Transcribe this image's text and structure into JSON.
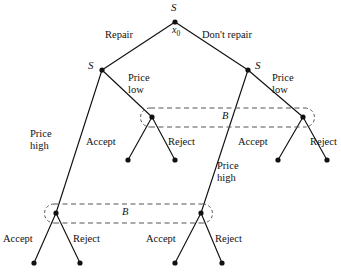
{
  "figure": {
    "kind": "extensive-form game tree",
    "background": "#ffffff",
    "ink": "#111111",
    "dash_color": "#555555",
    "width": 341,
    "height": 275
  },
  "nodes": {
    "root": {
      "label": "S",
      "name_label": "x0",
      "x": 175,
      "y": 22
    },
    "left_seller": {
      "label": "S",
      "x": 102,
      "y": 70
    },
    "right_seller": {
      "label": "S",
      "x": 248,
      "y": 70
    },
    "buyer_upper_left": {
      "label": "",
      "x": 152,
      "y": 117
    },
    "buyer_upper_right": {
      "label": "",
      "x": 303,
      "y": 117
    },
    "buyer_lower_left": {
      "label": "",
      "x": 56,
      "y": 213
    },
    "buyer_lower_right": {
      "label": "",
      "x": 201,
      "y": 213
    }
  },
  "leaves": [
    {
      "id": "leaf-1",
      "x": 128,
      "y": 160
    },
    {
      "id": "leaf-2",
      "x": 175,
      "y": 160
    },
    {
      "id": "leaf-3",
      "x": 278,
      "y": 160
    },
    {
      "id": "leaf-4",
      "x": 327,
      "y": 160
    },
    {
      "id": "leaf-5",
      "x": 34,
      "y": 263
    },
    {
      "id": "leaf-6",
      "x": 80,
      "y": 263
    },
    {
      "id": "leaf-7",
      "x": 175,
      "y": 263
    },
    {
      "id": "leaf-8",
      "x": 222,
      "y": 263
    }
  ],
  "actions": {
    "repair": "Repair",
    "dont_repair": "Don't repair",
    "price_low_left": "Price\nlow",
    "price_low_right": "Price\nlow",
    "price_high_left": "Price\nhigh",
    "price_high_right": "Price\nhigh",
    "accept_1": "Accept",
    "reject_1": "Reject",
    "accept_2": "Accept",
    "reject_2": "Reject",
    "accept_3": "Accept",
    "reject_3": "Reject",
    "accept_4": "Accept",
    "reject_4": "Reject"
  },
  "information_sets": [
    {
      "id": "iset-upper",
      "label": "B",
      "left_x": 152,
      "right_x": 303,
      "y": 117
    },
    {
      "id": "iset-lower",
      "label": "B",
      "left_x": 56,
      "right_x": 201,
      "y": 213
    }
  ]
}
